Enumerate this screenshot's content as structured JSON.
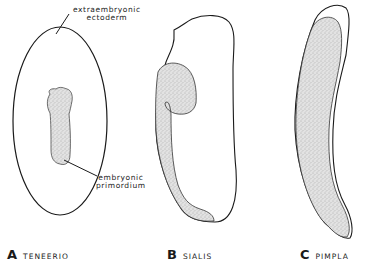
{
  "figure": {
    "callouts": {
      "extraembryonic_line1": "extraembryonic",
      "extraembryonic_line2": "ectoderm",
      "primordium_line1": "embryonic",
      "primordium_line2": "primordium"
    },
    "panels": [
      {
        "letter": "A",
        "name": "TENEERIO"
      },
      {
        "letter": "B",
        "name": "SIALIS"
      },
      {
        "letter": "C",
        "name": "PIMPLA"
      }
    ],
    "colors": {
      "outline": "#1a1a1a",
      "stipple_fill": "#d4d4d4",
      "background": "#ffffff"
    }
  }
}
